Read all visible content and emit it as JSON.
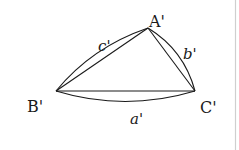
{
  "diagram": {
    "type": "spherical-triangle",
    "vertices": {
      "A": {
        "label": "A'",
        "x": 148,
        "y": 28
      },
      "B": {
        "label": "B'",
        "x": 56,
        "y": 91
      },
      "C": {
        "label": "C'",
        "x": 195,
        "y": 91
      }
    },
    "sides": {
      "a": {
        "label": "a'",
        "between": [
          "B'",
          "C'"
        ]
      },
      "b": {
        "label": "b'",
        "between": [
          "A'",
          "C'"
        ]
      },
      "c": {
        "label": "c'",
        "between": [
          "B'",
          "A'"
        ]
      }
    },
    "colors": {
      "stroke": "#1a1a1a",
      "border": "#cfcfcf",
      "background": "#ffffff"
    }
  }
}
